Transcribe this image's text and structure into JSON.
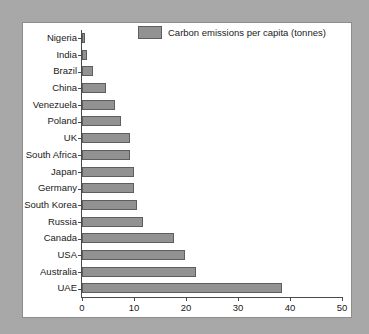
{
  "chart_data": {
    "type": "bar",
    "orientation": "horizontal",
    "title": "",
    "xlabel": "",
    "ylabel": "",
    "xlim": [
      0,
      50
    ],
    "xticks": [
      0,
      10,
      20,
      30,
      40,
      50
    ],
    "grid": false,
    "legend": {
      "position": "top-center",
      "entries": [
        {
          "name": "Carbon emissions per capita (tonnes)",
          "color": "#929292"
        }
      ]
    },
    "series_name": "Carbon emissions per capita (tonnes)",
    "categories": [
      "Nigeria",
      "India",
      "Brazil",
      "China",
      "Venezuela",
      "Poland",
      "UK",
      "South Africa",
      "Japan",
      "Germany",
      "South Korea",
      "Russia",
      "Canada",
      "USA",
      "Australia",
      "UAE"
    ],
    "values": [
      0.6,
      1.0,
      2.2,
      4.6,
      6.3,
      7.5,
      9.3,
      9.3,
      10.0,
      10.0,
      10.6,
      11.7,
      17.7,
      19.8,
      21.9,
      38.5
    ],
    "colors": {
      "bar_fill": "#929292",
      "bar_edge": "#5e5e5e",
      "panel_background": "#ffffff",
      "page_background": "#a8a8a8",
      "axis": "#4a4a4a",
      "text": "#1a1a1a"
    }
  }
}
